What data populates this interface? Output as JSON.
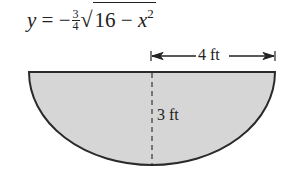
{
  "formula": {
    "lhs": "y",
    "equals": "=",
    "sign": "−",
    "fraction": {
      "numerator": "3",
      "denominator": "4"
    },
    "radical_sign": "√",
    "radicand_const": "16",
    "minus": "−",
    "radicand_var": "x",
    "exponent": "2"
  },
  "diagram": {
    "shape": "half-ellipse (semi-elliptical cross-section)",
    "fill_color": "#d6d6d6",
    "stroke_color": "#2a2a2a",
    "width_label": "4 ft",
    "depth_label": "3 ft"
  }
}
